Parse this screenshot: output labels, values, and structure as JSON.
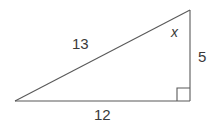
{
  "figure": {
    "type": "right-triangle-diagram",
    "background_color": "#ffffff",
    "stroke_color": "#595959",
    "label_color": "#3a3a3a",
    "labels": {
      "hypotenuse": "13",
      "base": "12",
      "vertical": "5",
      "angle": "x"
    },
    "vertices": {
      "left": [
        15,
        101
      ],
      "top_right": [
        190,
        10
      ],
      "bottom_right": [
        190,
        101
      ]
    },
    "right_angle_marker": {
      "name": "right-angle-square",
      "corner": [
        190,
        101
      ],
      "size": 13
    }
  }
}
